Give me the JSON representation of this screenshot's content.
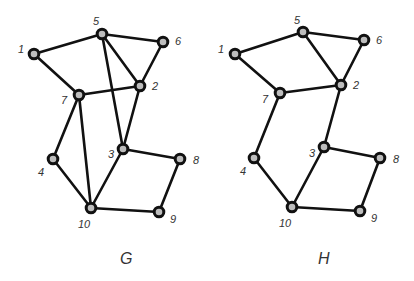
{
  "graphs": [
    {
      "name": "G",
      "label_pos": [
        120,
        264
      ],
      "nodes": [
        {
          "id": "1",
          "x": 34,
          "y": 54,
          "lx": 18,
          "ly": 53
        },
        {
          "id": "5",
          "x": 102,
          "y": 34,
          "lx": 93,
          "ly": 25
        },
        {
          "id": "6",
          "x": 163,
          "y": 42,
          "lx": 175,
          "ly": 45
        },
        {
          "id": "2",
          "x": 140,
          "y": 86,
          "lx": 152,
          "ly": 90
        },
        {
          "id": "7",
          "x": 79,
          "y": 95,
          "lx": 61,
          "ly": 104
        },
        {
          "id": "3",
          "x": 123,
          "y": 149,
          "lx": 108,
          "ly": 158
        },
        {
          "id": "4",
          "x": 53,
          "y": 159,
          "lx": 38,
          "ly": 176
        },
        {
          "id": "8",
          "x": 180,
          "y": 159,
          "lx": 193,
          "ly": 164
        },
        {
          "id": "10",
          "x": 91,
          "y": 208,
          "lx": 78,
          "ly": 228
        },
        {
          "id": "9",
          "x": 159,
          "y": 212,
          "lx": 170,
          "ly": 223
        }
      ],
      "edges": [
        [
          "1",
          "5"
        ],
        [
          "1",
          "7"
        ],
        [
          "5",
          "6"
        ],
        [
          "5",
          "2"
        ],
        [
          "5",
          "3"
        ],
        [
          "6",
          "2"
        ],
        [
          "7",
          "2"
        ],
        [
          "7",
          "4"
        ],
        [
          "7",
          "10"
        ],
        [
          "2",
          "3"
        ],
        [
          "4",
          "10"
        ],
        [
          "3",
          "10"
        ],
        [
          "3",
          "8"
        ],
        [
          "8",
          "9"
        ],
        [
          "10",
          "9"
        ]
      ]
    },
    {
      "name": "H",
      "label_pos": [
        318,
        264
      ],
      "nodes": [
        {
          "id": "1",
          "x": 235,
          "y": 54,
          "lx": 218,
          "ly": 53
        },
        {
          "id": "5",
          "x": 303,
          "y": 32,
          "lx": 294,
          "ly": 24
        },
        {
          "id": "6",
          "x": 364,
          "y": 40,
          "lx": 376,
          "ly": 44
        },
        {
          "id": "2",
          "x": 341,
          "y": 85,
          "lx": 353,
          "ly": 89
        },
        {
          "id": "7",
          "x": 280,
          "y": 93,
          "lx": 262,
          "ly": 103
        },
        {
          "id": "3",
          "x": 324,
          "y": 147,
          "lx": 309,
          "ly": 157
        },
        {
          "id": "4",
          "x": 254,
          "y": 158,
          "lx": 240,
          "ly": 175
        },
        {
          "id": "8",
          "x": 380,
          "y": 158,
          "lx": 393,
          "ly": 163
        },
        {
          "id": "10",
          "x": 292,
          "y": 207,
          "lx": 279,
          "ly": 227
        },
        {
          "id": "9",
          "x": 360,
          "y": 211,
          "lx": 371,
          "ly": 222
        }
      ],
      "edges": [
        [
          "1",
          "5"
        ],
        [
          "1",
          "7"
        ],
        [
          "5",
          "6"
        ],
        [
          "5",
          "2"
        ],
        [
          "6",
          "2"
        ],
        [
          "7",
          "2"
        ],
        [
          "7",
          "4"
        ],
        [
          "2",
          "3"
        ],
        [
          "4",
          "10"
        ],
        [
          "3",
          "10"
        ],
        [
          "3",
          "8"
        ],
        [
          "8",
          "9"
        ],
        [
          "10",
          "9"
        ]
      ]
    }
  ]
}
